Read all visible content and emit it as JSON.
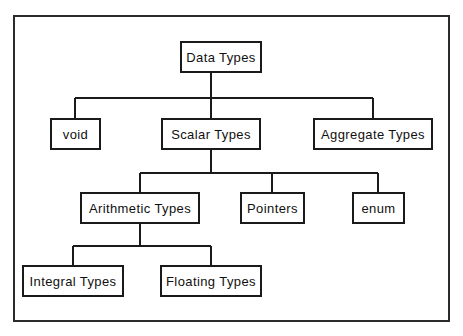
{
  "figure": {
    "kind": "tree-diagram",
    "frame_color": "#2b2b2b",
    "node_border_color": "#1a1a1a",
    "node_fill_color": "#ffffff",
    "connector_color": "#1a1a1a",
    "background_color": "#ffffff"
  },
  "nodes": {
    "data_types": {
      "label": "Data Types",
      "level": 1
    },
    "void": {
      "label": "void",
      "level": 2
    },
    "scalar_types": {
      "label": "Scalar Types",
      "level": 2
    },
    "aggregate_types": {
      "label": "Aggregate Types",
      "level": 2
    },
    "arithmetic_types": {
      "label": "Arithmetic Types",
      "level": 3
    },
    "pointers": {
      "label": "Pointers",
      "level": 3
    },
    "enum": {
      "label": "enum",
      "level": 3
    },
    "integral_types": {
      "label": "Integral Types",
      "level": 4
    },
    "floating_types": {
      "label": "Floating Types",
      "level": 4
    }
  },
  "edges": [
    {
      "from": "data_types",
      "to": "void"
    },
    {
      "from": "data_types",
      "to": "scalar_types"
    },
    {
      "from": "data_types",
      "to": "aggregate_types"
    },
    {
      "from": "scalar_types",
      "to": "arithmetic_types"
    },
    {
      "from": "scalar_types",
      "to": "pointers"
    },
    {
      "from": "scalar_types",
      "to": "enum"
    },
    {
      "from": "arithmetic_types",
      "to": "integral_types"
    },
    {
      "from": "arithmetic_types",
      "to": "floating_types"
    }
  ]
}
